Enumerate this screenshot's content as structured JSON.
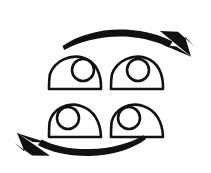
{
  "image": {
    "kind": "line-art-diagram",
    "subject": "eye-movement-rotation-exercise",
    "background_color": "#ffffff",
    "ink_color": "#111111",
    "width": 211,
    "height": 173
  },
  "figure": {
    "title": "",
    "caption": "",
    "has_text_labels": false
  },
  "eyes": [
    {
      "id": "eye-top-left",
      "row": "top",
      "side": "left",
      "gaze_direction": "right",
      "center_x": 75,
      "center_y": 78,
      "half_width": 26,
      "height": 22,
      "pupil": {
        "center_x": 83,
        "center_y": 70,
        "radius": 11,
        "position": "right"
      }
    },
    {
      "id": "eye-top-right",
      "row": "top",
      "side": "right",
      "gaze_direction": "right",
      "center_x": 137,
      "center_y": 78,
      "half_width": 26,
      "height": 22,
      "pupil": {
        "center_x": 138,
        "center_y": 70,
        "radius": 11,
        "position": "right"
      }
    },
    {
      "id": "eye-bottom-left",
      "row": "bottom",
      "side": "left",
      "gaze_direction": "left",
      "center_x": 75,
      "center_y": 126,
      "half_width": 26,
      "height": 22,
      "pupil": {
        "center_x": 68,
        "center_y": 118,
        "radius": 11,
        "position": "left"
      }
    },
    {
      "id": "eye-bottom-right",
      "row": "bottom",
      "side": "right",
      "gaze_direction": "left",
      "center_x": 137,
      "center_y": 126,
      "half_width": 26,
      "height": 22,
      "pupil": {
        "center_x": 129,
        "center_y": 118,
        "radius": 11,
        "position": "left"
      }
    }
  ],
  "arrows": [
    {
      "id": "arrow-top",
      "label": "",
      "direction": "rightward",
      "placement": "above-eyes",
      "head_position": "right-end",
      "style": "tapered-brush-curve"
    },
    {
      "id": "arrow-bottom",
      "label": "",
      "direction": "leftward",
      "placement": "below-eyes",
      "head_position": "left-end",
      "style": "tapered-brush-curve"
    }
  ]
}
